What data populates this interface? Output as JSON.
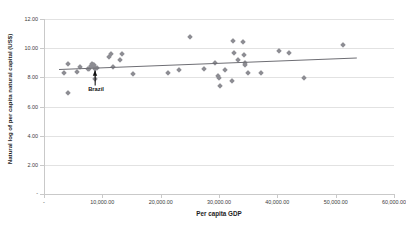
{
  "chart_data": {
    "type": "scatter",
    "title": "",
    "xlabel": "Per capita GDP",
    "ylabel": "Natural log of per capita natural capital (US$)",
    "xlim": [
      0,
      60000
    ],
    "ylim": [
      0,
      12
    ],
    "grid": true,
    "legend": "none",
    "x_ticks": [
      "-",
      "10,000.00",
      "20,000.00",
      "30,000.00",
      "40,000.00",
      "50,000.00",
      "60,000.00"
    ],
    "x_tick_values": [
      0,
      10000,
      20000,
      30000,
      40000,
      50000,
      60000
    ],
    "y_ticks": [
      "-",
      "2.00",
      "4.00",
      "6.00",
      "8.00",
      "10.00",
      "12.00"
    ],
    "y_tick_values": [
      0,
      2,
      4,
      6,
      8,
      10,
      12
    ],
    "series": [
      {
        "name": "Countries",
        "marker": "diamond",
        "color": "#8d8d93",
        "points": [
          {
            "x": 3400,
            "y": 8.28
          },
          {
            "x": 4050,
            "y": 8.9
          },
          {
            "x": 4150,
            "y": 6.92
          },
          {
            "x": 5600,
            "y": 8.4
          },
          {
            "x": 6150,
            "y": 8.68
          },
          {
            "x": 7500,
            "y": 8.55
          },
          {
            "x": 7700,
            "y": 8.6
          },
          {
            "x": 8050,
            "y": 8.78
          },
          {
            "x": 8250,
            "y": 8.9
          },
          {
            "x": 8400,
            "y": 8.86
          },
          {
            "x": 8500,
            "y": 8.72
          },
          {
            "x": 8600,
            "y": 8.82
          },
          {
            "x": 8700,
            "y": 7.9
          },
          {
            "x": 8800,
            "y": 8.6
          },
          {
            "x": 9150,
            "y": 8.62
          },
          {
            "x": 11200,
            "y": 9.42
          },
          {
            "x": 11500,
            "y": 9.58
          },
          {
            "x": 11800,
            "y": 8.72
          },
          {
            "x": 13100,
            "y": 9.22
          },
          {
            "x": 13400,
            "y": 9.57
          },
          {
            "x": 15300,
            "y": 8.25
          },
          {
            "x": 21300,
            "y": 8.28
          },
          {
            "x": 23100,
            "y": 8.5
          },
          {
            "x": 25100,
            "y": 10.8
          },
          {
            "x": 27500,
            "y": 8.58
          },
          {
            "x": 29300,
            "y": 8.98
          },
          {
            "x": 29900,
            "y": 8.08
          },
          {
            "x": 29950,
            "y": 7.98
          },
          {
            "x": 30200,
            "y": 7.42
          },
          {
            "x": 31000,
            "y": 8.48
          },
          {
            "x": 32300,
            "y": 7.72
          },
          {
            "x": 32400,
            "y": 10.48
          },
          {
            "x": 32500,
            "y": 9.68
          },
          {
            "x": 33200,
            "y": 9.22
          },
          {
            "x": 34100,
            "y": 10.45
          },
          {
            "x": 34300,
            "y": 9.55
          },
          {
            "x": 34400,
            "y": 8.88
          },
          {
            "x": 34500,
            "y": 8.95
          },
          {
            "x": 34900,
            "y": 8.28
          },
          {
            "x": 37200,
            "y": 8.28
          },
          {
            "x": 40300,
            "y": 9.78
          },
          {
            "x": 42000,
            "y": 9.68
          },
          {
            "x": 44600,
            "y": 7.95
          },
          {
            "x": 51200,
            "y": 10.25
          }
        ]
      }
    ],
    "trendline": {
      "x_start": 2600,
      "y_start": 8.56,
      "x_end": 53600,
      "y_end": 9.34,
      "color": "#6e6e74"
    },
    "annotations": [
      {
        "label": "Brazil",
        "label_x": 8600,
        "label_y": 7.1,
        "target_x": 8350,
        "target_y": 8.62
      }
    ]
  }
}
